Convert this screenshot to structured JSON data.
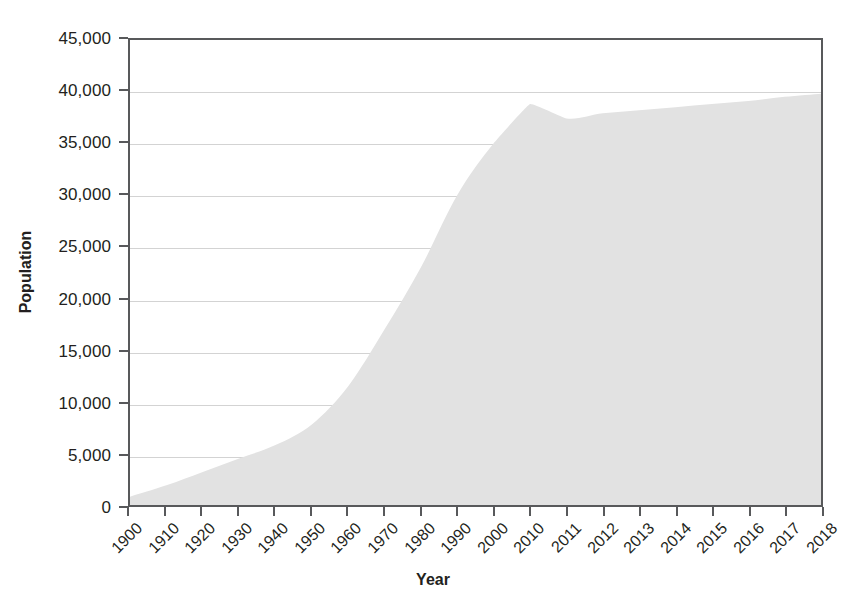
{
  "chart_data": {
    "type": "area",
    "title": "",
    "xlabel": "Year",
    "ylabel": "Population",
    "grid": true,
    "legend": false,
    "ylim": [
      0,
      45000
    ],
    "ytick_labels": [
      "45,000",
      "40,000",
      "35,000",
      "30,000",
      "25,000",
      "20,000",
      "15,000",
      "10,000",
      "5,000",
      "0"
    ],
    "ytick_values": [
      45000,
      40000,
      35000,
      30000,
      25000,
      20000,
      15000,
      10000,
      5000,
      0
    ],
    "categories": [
      "1900",
      "1910",
      "1920",
      "1930",
      "1940",
      "1950",
      "1960",
      "1970",
      "1980",
      "1990",
      "2000",
      "2010",
      "2011",
      "2012",
      "2013",
      "2014",
      "2015",
      "2016",
      "2017",
      "2018"
    ],
    "values": [
      800,
      1900,
      3200,
      4500,
      5800,
      7800,
      11500,
      17000,
      23000,
      30000,
      35000,
      38800,
      37400,
      37900,
      38200,
      38500,
      38800,
      39100,
      39500,
      39800
    ],
    "series": [
      {
        "name": "Population",
        "values": [
          800,
          1900,
          3200,
          4500,
          5800,
          7800,
          11500,
          17000,
          23000,
          30000,
          35000,
          38800,
          37400,
          37900,
          38200,
          38500,
          38800,
          39100,
          39500,
          39800
        ]
      }
    ],
    "area_fill_color": "#e2e2e2",
    "axis_color": "#58595b",
    "grid_color": "#d3d3d3",
    "text_color": "#231f20"
  }
}
